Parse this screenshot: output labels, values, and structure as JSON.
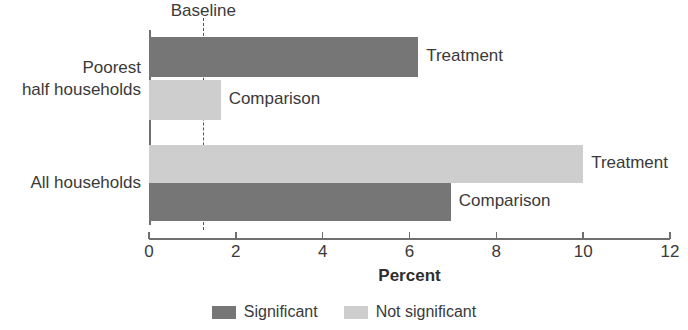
{
  "chart_data": {
    "type": "bar",
    "orientation": "horizontal",
    "title": "",
    "xlabel": "Percent",
    "ylabel": "",
    "xlim": [
      0,
      12
    ],
    "xticks": [
      0,
      2,
      4,
      6,
      8,
      10,
      12
    ],
    "xtick_labels": [
      "0",
      "2",
      "4",
      "6",
      "8",
      "10",
      "12"
    ],
    "grid": false,
    "categories": [
      "Poorest half households",
      "All households"
    ],
    "category_labels": [
      "Poorest\nhalf households",
      "All households"
    ],
    "annotations": {
      "baseline_label": "Baseline",
      "baseline_value": 1.25
    },
    "legend": {
      "position": "bottom",
      "entries": [
        {
          "label": "Significant",
          "color": "#767676"
        },
        {
          "label": "Not significant",
          "color": "#cecece"
        }
      ]
    },
    "bars": [
      {
        "category": "Poorest half households",
        "series": "Treatment",
        "label": "Treatment",
        "value": 6.2,
        "significance": "Significant",
        "color": "#767676"
      },
      {
        "category": "Poorest half households",
        "series": "Comparison",
        "label": "Comparison",
        "value": 1.65,
        "significance": "Not significant",
        "color": "#cecece"
      },
      {
        "category": "All households",
        "series": "Treatment",
        "label": "Treatment",
        "value": 10.0,
        "significance": "Not significant",
        "color": "#cecece"
      },
      {
        "category": "All households",
        "series": "Comparison",
        "label": "Comparison",
        "value": 6.95,
        "significance": "Significant",
        "color": "#767676"
      }
    ]
  }
}
